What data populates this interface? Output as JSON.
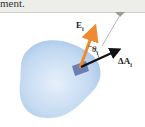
{
  "banner": {
    "text": "ment."
  },
  "diagram": {
    "surface": {
      "fill": "#bcd6ef",
      "edge": "#9fc0e4"
    },
    "patch": {
      "fill": "#6d7fb0"
    },
    "vectors": {
      "field": {
        "symbol": "E",
        "subscript": "i",
        "color": "#f08a2e"
      },
      "area": {
        "symbol": "ΔA",
        "subscript": "i",
        "color": "#111111"
      }
    },
    "angle": {
      "symbol": "θ",
      "subscript": "i"
    },
    "callout_line_color": "#b8b8b4"
  }
}
